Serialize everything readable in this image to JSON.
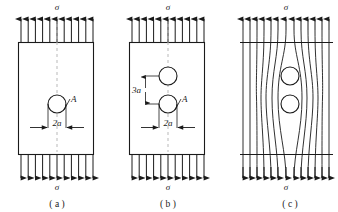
{
  "figure": {
    "title": "",
    "panels": [
      {
        "id": "a",
        "caption": "( a )",
        "stress_label_top": "σ",
        "stress_label_bottom": "σ",
        "hole_label": "A",
        "dimension_horizontal": "2a",
        "holes": 1,
        "arrow_count_top": 11,
        "arrow_count_bottom": 11,
        "centerline": "dashed"
      },
      {
        "id": "b",
        "caption": "( b )",
        "stress_label_top": "σ",
        "stress_label_bottom": "σ",
        "hole_label": "A",
        "dimension_horizontal": "2a",
        "dimension_vertical": "3a",
        "holes": 2,
        "arrow_count_top": 11,
        "arrow_count_bottom": 11,
        "centerline": "dashed"
      },
      {
        "id": "c",
        "caption": "( c )",
        "stress_label_top": "σ",
        "stress_label_bottom": "σ",
        "holes": 2,
        "arrow_count_top": 13,
        "arrow_count_bottom": 13,
        "flow_lines": 13,
        "description": "stress-flow-lines-around-holes"
      }
    ],
    "colors": {
      "line": "#1a1a1a",
      "centerline": "#b0b0b0",
      "background": "#ffffff"
    }
  }
}
